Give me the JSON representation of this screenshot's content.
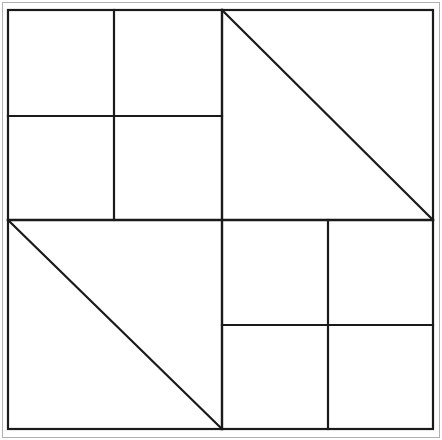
{
  "figure": {
    "canvas": {
      "width": 442,
      "height": 440,
      "background": "#ffffff"
    },
    "colors": {
      "outer_border": "#b0b0b0",
      "line": "#1a1a1a",
      "fill": "#ffffff"
    },
    "stroke_widths": {
      "outer_border": 1,
      "frame": 2.2,
      "divider": 2.4,
      "inner": 2.2,
      "diagonal": 2.2
    },
    "outer_border": {
      "x": 2,
      "y": 2,
      "width": 438,
      "height": 436
    },
    "frame": {
      "x1": 8,
      "y1": 10,
      "x2": 433,
      "y2": 429
    },
    "center": {
      "x": 222,
      "y": 220
    },
    "quadrants": [
      {
        "name": "top-left",
        "bounds": {
          "x1": 8,
          "y1": 10,
          "x2": 222,
          "y2": 220
        },
        "pattern": "cross-split",
        "split_x": 114,
        "split_y": 116,
        "cells": 4
      },
      {
        "name": "top-right",
        "bounds": {
          "x1": 222,
          "y1": 10,
          "x2": 433,
          "y2": 220
        },
        "pattern": "diagonal",
        "diagonal": {
          "x1": 222,
          "y1": 10,
          "x2": 433,
          "y2": 220
        },
        "cells": 2
      },
      {
        "name": "bottom-left",
        "bounds": {
          "x1": 8,
          "y1": 220,
          "x2": 222,
          "y2": 429
        },
        "pattern": "diagonal",
        "diagonal": {
          "x1": 8,
          "y1": 220,
          "x2": 222,
          "y2": 429
        },
        "cells": 2
      },
      {
        "name": "bottom-right",
        "bounds": {
          "x1": 222,
          "y1": 220,
          "x2": 433,
          "y2": 429
        },
        "pattern": "cross-split",
        "split_x": 328,
        "split_y": 325,
        "cells": 4
      }
    ],
    "segments": [
      {
        "name": "divider-vertical-center",
        "x1": 222,
        "y1": 10,
        "x2": 222,
        "y2": 429,
        "kind": "divider"
      },
      {
        "name": "divider-horizontal-center",
        "x1": 8,
        "y1": 220,
        "x2": 433,
        "y2": 220,
        "kind": "divider"
      },
      {
        "name": "tl-split-vertical",
        "x1": 114,
        "y1": 10,
        "x2": 114,
        "y2": 220,
        "kind": "inner"
      },
      {
        "name": "tl-split-horizontal",
        "x1": 8,
        "y1": 116,
        "x2": 222,
        "y2": 116,
        "kind": "inner"
      },
      {
        "name": "br-split-vertical",
        "x1": 328,
        "y1": 220,
        "x2": 328,
        "y2": 429,
        "kind": "inner"
      },
      {
        "name": "br-split-horizontal",
        "x1": 222,
        "y1": 325,
        "x2": 433,
        "y2": 325,
        "kind": "inner"
      },
      {
        "name": "tr-diagonal",
        "x1": 222,
        "y1": 10,
        "x2": 433,
        "y2": 220,
        "kind": "diagonal"
      },
      {
        "name": "bl-diagonal",
        "x1": 8,
        "y1": 220,
        "x2": 222,
        "y2": 429,
        "kind": "diagonal"
      }
    ]
  }
}
